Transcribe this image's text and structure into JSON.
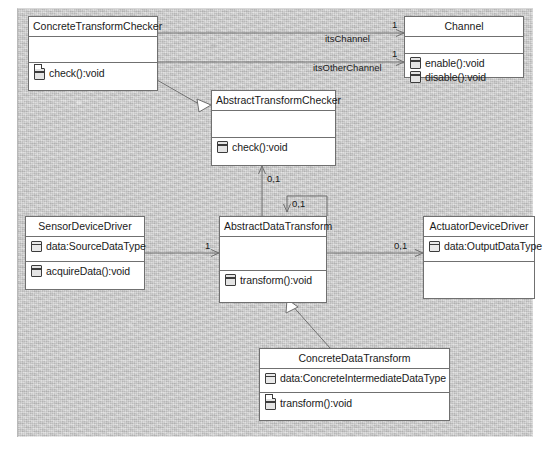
{
  "diagram": {
    "type": "uml-class-diagram",
    "classes": [
      {
        "id": "ConcreteTransformChecker",
        "name": "ConcreteTransformChecker",
        "attributes": [],
        "operations": [
          {
            "label": "check():void",
            "icon": "operation-overridden-icon"
          }
        ]
      },
      {
        "id": "Channel",
        "name": "Channel",
        "attributes": [],
        "operations": [
          {
            "label": "enable():void",
            "icon": "operation-icon"
          },
          {
            "label": "disable():void",
            "icon": "operation-icon"
          }
        ]
      },
      {
        "id": "AbstractTransformChecker",
        "name": "AbstractTransformChecker",
        "attributes": [],
        "operations": [
          {
            "label": "check():void",
            "icon": "operation-icon"
          }
        ]
      },
      {
        "id": "SensorDeviceDriver",
        "name": "SensorDeviceDriver",
        "attributes": [
          {
            "label": "data:SourceDataType",
            "icon": "attribute-icon"
          }
        ],
        "operations": [
          {
            "label": "acquireData():void",
            "icon": "operation-icon"
          }
        ]
      },
      {
        "id": "AbstractDataTransform",
        "name": "AbstractDataTransform",
        "attributes": [],
        "operations": [
          {
            "label": "transform():void",
            "icon": "operation-icon"
          }
        ]
      },
      {
        "id": "ActuatorDeviceDriver",
        "name": "ActuatorDeviceDriver",
        "attributes": [
          {
            "label": "data:OutputDataType",
            "icon": "attribute-icon"
          }
        ],
        "operations": []
      },
      {
        "id": "ConcreteDataTransform",
        "name": "ConcreteDataTransform",
        "attributes": [
          {
            "label": "data:ConcreteIntermediateDataType",
            "icon": "attribute-icon"
          }
        ],
        "operations": [
          {
            "label": "transform():void",
            "icon": "operation-overridden-icon"
          }
        ]
      }
    ],
    "edge_labels": {
      "channel_multiplicity": "1",
      "channel_role": "itsChannel",
      "other_channel_multiplicity": "1",
      "other_channel_role": "itsOtherChannel",
      "checker_multiplicity": "0,1",
      "self_multiplicity": "0,1",
      "sensor_multiplicity": "1",
      "actuator_multiplicity": "0,1"
    },
    "relationships": [
      {
        "from": "ConcreteTransformChecker",
        "to": "AbstractTransformChecker",
        "kind": "generalization"
      },
      {
        "from": "ConcreteDataTransform",
        "to": "AbstractDataTransform",
        "kind": "generalization"
      },
      {
        "from": "ConcreteTransformChecker",
        "to": "Channel",
        "kind": "association",
        "role": "itsChannel",
        "multiplicity": "1"
      },
      {
        "from": "ConcreteTransformChecker",
        "to": "Channel",
        "kind": "association",
        "role": "itsOtherChannel",
        "multiplicity": "1"
      },
      {
        "from": "AbstractDataTransform",
        "to": "AbstractTransformChecker",
        "kind": "association",
        "multiplicity": "0,1"
      },
      {
        "from": "AbstractDataTransform",
        "to": "AbstractDataTransform",
        "kind": "association",
        "multiplicity": "0,1"
      },
      {
        "from": "SensorDeviceDriver",
        "to": "AbstractDataTransform",
        "kind": "association",
        "multiplicity": "1"
      },
      {
        "from": "AbstractDataTransform",
        "to": "ActuatorDeviceDriver",
        "kind": "association",
        "multiplicity": "0,1"
      }
    ],
    "colors": {
      "canvas": "#cfcfcf",
      "box_fill": "#ffffff",
      "stroke": "#707070",
      "text": "#1a1a1a"
    }
  }
}
